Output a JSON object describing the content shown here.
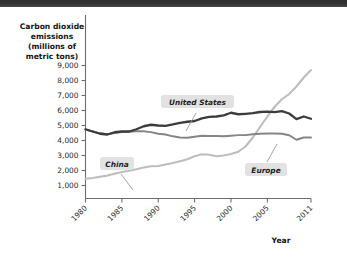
{
  "banner": {
    "name": "top-dark-banner"
  },
  "chart_data": {
    "type": "line",
    "title": "",
    "xlabel": "Year",
    "ylabel": "Carbon dioxide emissions (millions of metric tons)",
    "ylabel_lines": [
      "Carbon dioxide",
      "emissions",
      "(millions of",
      "metric tons)"
    ],
    "xlim": [
      1980,
      2011
    ],
    "ylim": [
      0,
      9500
    ],
    "grid": false,
    "legend_position": "inline-callouts",
    "ytick_labels": [
      "1,000",
      "2,000",
      "3,000",
      "4,000",
      "5,000",
      "6,000",
      "7,000",
      "8,000",
      "9,000"
    ],
    "ytick_values": [
      1000,
      2000,
      3000,
      4000,
      5000,
      6000,
      7000,
      8000,
      9000
    ],
    "xtick_labels": [
      "1980",
      "1985",
      "1990",
      "1995",
      "2000",
      "2005",
      "2011"
    ],
    "xtick_values": [
      1980,
      1985,
      1990,
      1995,
      2000,
      2005,
      2011
    ],
    "x": [
      1980,
      1981,
      1982,
      1983,
      1984,
      1985,
      1986,
      1987,
      1988,
      1989,
      1990,
      1991,
      1992,
      1993,
      1994,
      1995,
      1996,
      1997,
      1998,
      1999,
      2000,
      2001,
      2002,
      2003,
      2004,
      2005,
      2006,
      2007,
      2008,
      2009,
      2010,
      2011
    ],
    "series": [
      {
        "name": "United States",
        "color": "#3c3c3c",
        "values": [
          4750,
          4600,
          4450,
          4400,
          4550,
          4600,
          4600,
          4750,
          4950,
          5050,
          5000,
          4980,
          5070,
          5180,
          5250,
          5300,
          5480,
          5580,
          5600,
          5670,
          5850,
          5750,
          5780,
          5820,
          5900,
          5930,
          5890,
          5960,
          5800,
          5420,
          5600,
          5450
        ]
      },
      {
        "name": "Europe",
        "color": "#858585",
        "values": [
          4720,
          4600,
          4480,
          4420,
          4500,
          4560,
          4580,
          4620,
          4620,
          4560,
          4450,
          4400,
          4280,
          4200,
          4180,
          4250,
          4320,
          4300,
          4300,
          4280,
          4320,
          4360,
          4360,
          4420,
          4450,
          4470,
          4470,
          4450,
          4350,
          4050,
          4200,
          4200
        ]
      },
      {
        "name": "China",
        "color": "#bdbdbd",
        "values": [
          1450,
          1500,
          1580,
          1660,
          1790,
          1900,
          1980,
          2080,
          2200,
          2280,
          2300,
          2400,
          2500,
          2620,
          2750,
          2950,
          3080,
          3050,
          2950,
          3000,
          3100,
          3250,
          3600,
          4200,
          4900,
          5600,
          6250,
          6750,
          7100,
          7600,
          8200,
          8700
        ]
      }
    ],
    "callouts": [
      {
        "label": "United States",
        "series": "United States"
      },
      {
        "label": "China",
        "series": "China"
      },
      {
        "label": "Europe",
        "series": "Europe"
      }
    ]
  }
}
